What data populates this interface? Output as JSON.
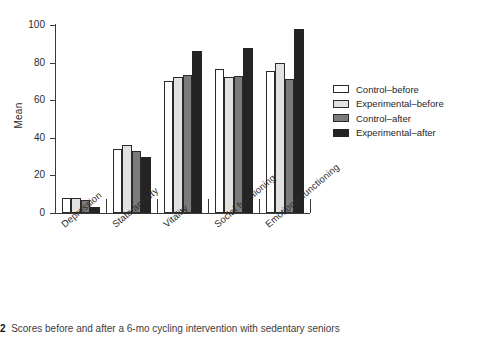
{
  "chart_data": {
    "type": "bar",
    "title": "",
    "xlabel": "",
    "ylabel": "Mean",
    "ylim": [
      0,
      100
    ],
    "yticks": [
      0,
      20,
      40,
      60,
      80,
      100
    ],
    "grid": false,
    "legend_position": "right",
    "categories": [
      "Depression",
      "State anxiety",
      "Vitality",
      "Social functioning",
      "Emotional functioning"
    ],
    "series": [
      {
        "name": "Control–before",
        "color": "#ffffff",
        "values": [
          8,
          34,
          70,
          76.5,
          75.5
        ]
      },
      {
        "name": "Experimental–before",
        "color": "#e2e2e2",
        "values": [
          8,
          36,
          72.5,
          72.5,
          80
        ]
      },
      {
        "name": "Control–after",
        "color": "#7b7b7b",
        "values": [
          7,
          33,
          73.5,
          73,
          71.5
        ]
      },
      {
        "name": "Experimental–after",
        "color": "#242424",
        "values": [
          3,
          30,
          86,
          88,
          98
        ]
      }
    ]
  },
  "caption": {
    "figure_number": "2",
    "text": "Scores before and after a 6-mo cycling intervention with sedentary seniors"
  }
}
